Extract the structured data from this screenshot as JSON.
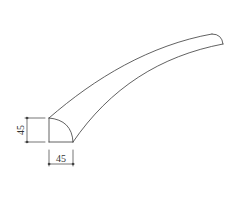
{
  "diagram": {
    "type": "technical-line-drawing",
    "stroke_color": "#3a3a3a",
    "background": "#ffffff",
    "dimensions": {
      "height": {
        "value": "45",
        "orientation": "vertical"
      },
      "width": {
        "value": "45",
        "orientation": "horizontal"
      }
    }
  }
}
